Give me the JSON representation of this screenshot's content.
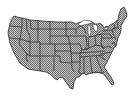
{
  "map": {
    "subject": "United States (contiguous states) outline map",
    "fill_style": "checkered hatch",
    "colors": {
      "background": "#ffffff",
      "fill_light": "#c8c8c8",
      "fill_dark": "#6e6e6e",
      "border": "#2a2a2a"
    }
  }
}
